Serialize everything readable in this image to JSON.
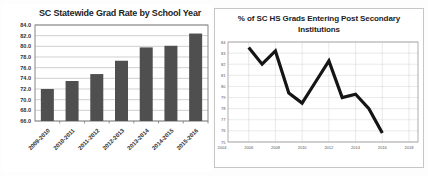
{
  "chart_data": [
    {
      "type": "bar",
      "title": "SC Statewide Grad Rate by School Year",
      "categories": [
        "2009-2010",
        "2010-2011",
        "2011-2012",
        "2012-2013",
        "2013-2014",
        "2014-2015",
        "2015-2016"
      ],
      "values": [
        72.0,
        73.5,
        74.8,
        77.3,
        79.8,
        80.1,
        82.4
      ],
      "xlabel": "",
      "ylabel": "",
      "ylim": [
        66.0,
        84.0
      ],
      "ytick_step": 2.0,
      "ytick_labels": [
        "84.0",
        "82.0",
        "80.0",
        "78.0",
        "76.0",
        "74.0",
        "72.0",
        "70.0",
        "68.0",
        "66.0"
      ],
      "grid": true,
      "legend": false,
      "bar_color": "#4f4f4f",
      "grid_color": "#bcbcbc",
      "axis_color": "#7a7a7a",
      "label_color": "#2e2e2e"
    },
    {
      "type": "line",
      "title": "% of SC HS Grads Entering Post Secondary Institutions",
      "x": [
        2006,
        2007,
        2008,
        2009,
        2010,
        2011,
        2012,
        2013,
        2014,
        2015,
        2016
      ],
      "values": [
        83.5,
        82.0,
        83.2,
        79.4,
        78.5,
        80.4,
        82.3,
        79.0,
        79.3,
        78.0,
        75.8
      ],
      "xtick_labels": [
        "2004",
        "2006",
        "2008",
        "2010",
        "2012",
        "2014",
        "2016",
        "2018"
      ],
      "ytick_labels": [
        "84",
        "83",
        "82",
        "81",
        "80",
        "79",
        "78",
        "77",
        "76",
        "75"
      ],
      "xlabel": "",
      "ylabel": "",
      "ylim": [
        75,
        84
      ],
      "ytick_step": 1,
      "grid": true,
      "legend": false,
      "line_color": "#151515",
      "grid_color": "#dadada",
      "axis_color": "#9a9a9a",
      "label_color": "#555555"
    }
  ]
}
